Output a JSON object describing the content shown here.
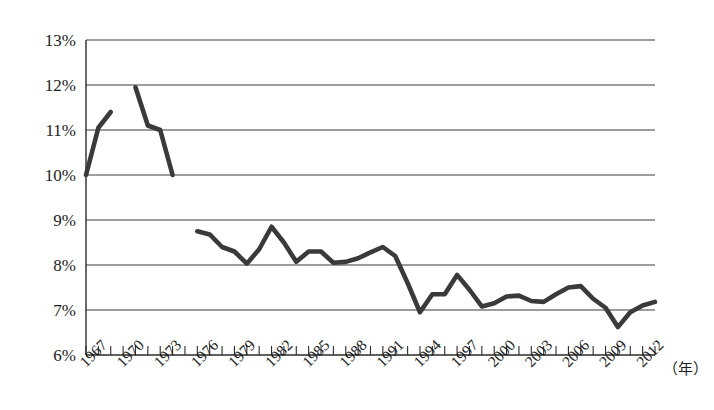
{
  "chart_data": {
    "type": "line",
    "title": "",
    "subtitle": "",
    "xlabel": "（年）",
    "ylabel": "",
    "ylim": [
      6,
      13
    ],
    "ytick_values": [
      6,
      7,
      8,
      9,
      10,
      11,
      12,
      13
    ],
    "ytick_labels": [
      "6%",
      "7%",
      "8%",
      "9%",
      "10%",
      "11%",
      "12%",
      "13%"
    ],
    "xlim": [
      1967,
      2013
    ],
    "xtick_labels": [
      "1967",
      "1970",
      "1973",
      "1976",
      "1979",
      "1982",
      "1985",
      "1988",
      "1991",
      "1994",
      "1997",
      "2000",
      "2003",
      "2006",
      "2009",
      "2012"
    ],
    "xtick_label_years": [
      1967,
      1970,
      1973,
      1976,
      1979,
      1982,
      1985,
      1988,
      1991,
      1994,
      1997,
      2000,
      2003,
      2006,
      2009,
      2012
    ],
    "xtick_minor_interval": 1,
    "grid": "horizontal",
    "legend": "none",
    "line_color": "#3a3a3a",
    "background_color": "#ffffff",
    "series": [
      {
        "name": "segment-1967-1969",
        "x": [
          1967,
          1968,
          1969
        ],
        "values": [
          10.0,
          11.05,
          11.4
        ]
      },
      {
        "name": "segment-1971-1974",
        "x": [
          1971,
          1972,
          1973,
          1974
        ],
        "values": [
          11.95,
          11.1,
          11.0,
          10.0
        ]
      },
      {
        "name": "segment-1976-2013",
        "x": [
          1976,
          1977,
          1978,
          1979,
          1980,
          1981,
          1982,
          1983,
          1984,
          1985,
          1986,
          1987,
          1988,
          1989,
          1990,
          1991,
          1992,
          1993,
          1994,
          1995,
          1996,
          1997,
          1998,
          1999,
          2000,
          2001,
          2002,
          2003,
          2004,
          2005,
          2006,
          2007,
          2008,
          2009,
          2010,
          2011,
          2012,
          2013
        ],
        "values": [
          8.75,
          8.68,
          8.4,
          8.3,
          8.03,
          8.35,
          8.85,
          8.5,
          8.07,
          8.3,
          8.3,
          8.05,
          8.07,
          8.15,
          8.28,
          8.4,
          8.2,
          7.6,
          6.95,
          7.35,
          7.35,
          7.78,
          7.45,
          7.08,
          7.15,
          7.3,
          7.32,
          7.2,
          7.18,
          7.35,
          7.5,
          7.53,
          7.25,
          7.05,
          6.62,
          6.95,
          7.1,
          7.18
        ]
      }
    ]
  },
  "axis": {
    "unit_label": "（年）"
  }
}
